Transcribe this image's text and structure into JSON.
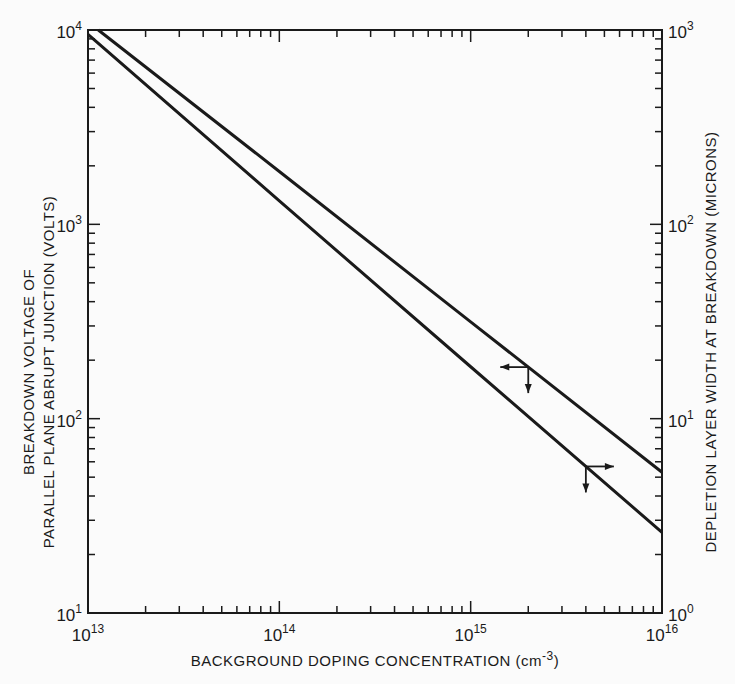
{
  "chart_data": {
    "type": "line",
    "title": "",
    "xlabel": "BACKGROUND DOPING CONCENTRATION (cm-3)",
    "ylabel_left": [
      "BREAKDOWN VOLTAGE OF",
      "PARALLEL PLANE ABRUPT JUNCTION (VOLTS)"
    ],
    "ylabel_right": "DEPLETION LAYER WIDTH AT BREAKDOWN (MICRONS)",
    "x_scale": "log",
    "y_scale": "log",
    "xlim": [
      10000000000000.0,
      1e+16
    ],
    "ylim_left": [
      10,
      10000
    ],
    "ylim_right": [
      1,
      1000
    ],
    "x_ticks": [
      {
        "base": "10",
        "exp": "13"
      },
      {
        "base": "10",
        "exp": "14"
      },
      {
        "base": "10",
        "exp": "15"
      },
      {
        "base": "10",
        "exp": "16"
      }
    ],
    "y_left_ticks": [
      {
        "base": "10",
        "exp": "4"
      },
      {
        "base": "10",
        "exp": "3"
      },
      {
        "base": "10",
        "exp": "2"
      },
      {
        "base": "10",
        "exp": "1"
      }
    ],
    "y_right_ticks": [
      {
        "base": "10",
        "exp": "3"
      },
      {
        "base": "10",
        "exp": "2"
      },
      {
        "base": "10",
        "exp": "1"
      },
      {
        "base": "10",
        "exp": "0"
      }
    ],
    "grid": false,
    "legend": null,
    "x": [
      10000000000000.0,
      100000000000000.0,
      1000000000000000.0,
      1e+16
    ],
    "series": [
      {
        "name": "Breakdown voltage (V)",
        "axis": "left",
        "indicator_arrow": "left",
        "values": [
          11000,
          1870,
          315,
          53
        ],
        "start_point": [
          11500000000000.0,
          10000
        ]
      },
      {
        "name": "Depletion layer width at breakdown (µm)",
        "axis": "right",
        "indicator_arrow": "right",
        "values": [
          950,
          132,
          18.5,
          2.6
        ]
      }
    ],
    "annotations": [
      {
        "type": "arrow-pair",
        "on_series": 0,
        "x": 2000000000000000.0,
        "direction": "left+down"
      },
      {
        "type": "arrow-pair",
        "on_series": 1,
        "x": 4000000000000000.0,
        "direction": "right+down"
      }
    ]
  },
  "labels": {
    "x_title": "BACKGROUND DOPING CONCENTRATION (cm",
    "x_title_sup": "-3",
    "x_title_end": ")",
    "y_left_line1": "BREAKDOWN VOLTAGE OF",
    "y_left_line2": "PARALLEL PLANE ABRUPT JUNCTION (VOLTS)",
    "y_right": "DEPLETION LAYER WIDTH AT BREAKDOWN (MICRONS)"
  },
  "colors": {
    "ink": "#1a1a1a",
    "paper": "#fbfbfb"
  }
}
